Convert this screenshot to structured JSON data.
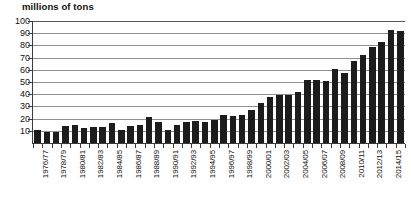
{
  "chart_data": {
    "type": "bar",
    "title": "millions of tons",
    "xlabel": "",
    "ylabel": "millions of tons",
    "ylim": [
      0,
      100
    ],
    "y_ticks": [
      10,
      20,
      30,
      40,
      50,
      60,
      70,
      80,
      90,
      100
    ],
    "grid": true,
    "legend": "none",
    "categories": [
      "1976/77",
      "1977/78",
      "1978/79",
      "1979/80",
      "1980/81",
      "1981/82",
      "1982/83",
      "1983/84",
      "1984/85",
      "1985/86",
      "1986/87",
      "1987/88",
      "1988/89",
      "1989/90",
      "1990/91",
      "1991/92",
      "1992/93",
      "1993/94",
      "1994/95",
      "1995/96",
      "1996/97",
      "1997/98",
      "1998/99",
      "1999/00",
      "2000/01",
      "2001/02",
      "2002/03",
      "2003/04",
      "2004/05",
      "2005/06",
      "2006/07",
      "2007/08",
      "2008/09",
      "2009/10",
      "2010/11",
      "2011/12",
      "2012/13",
      "2013/14",
      "2014/15",
      "2015/16"
    ],
    "values": [
      11,
      9,
      9,
      14,
      15,
      12,
      13,
      13,
      16,
      11,
      14,
      15,
      21,
      17,
      11,
      15,
      17,
      18,
      17,
      19,
      23,
      22,
      23,
      27,
      33,
      38,
      39,
      39,
      42,
      52,
      52,
      51,
      61,
      57,
      67,
      72,
      79,
      83,
      93,
      92
    ],
    "x_tick_labels": [
      "1976/77",
      "1978/79",
      "1980/81",
      "1982/83",
      "1984/85",
      "1986/87",
      "1988/89",
      "1990/91",
      "1992/93",
      "1994/95",
      "1996/97",
      "1998/99",
      "2000/01",
      "2002/03",
      "2004/05",
      "2006/07",
      "2008/09",
      "2010/11",
      "2012/13",
      "2014/15"
    ],
    "x_tick_indices": [
      0,
      2,
      4,
      6,
      8,
      10,
      12,
      14,
      16,
      18,
      20,
      22,
      24,
      26,
      28,
      30,
      32,
      34,
      36,
      38
    ],
    "colors": {
      "bar": "#1c1c1c",
      "grid": "#8f8f8f",
      "axis": "#3a3a3a",
      "text": "#111111",
      "background": "#ffffff"
    }
  }
}
